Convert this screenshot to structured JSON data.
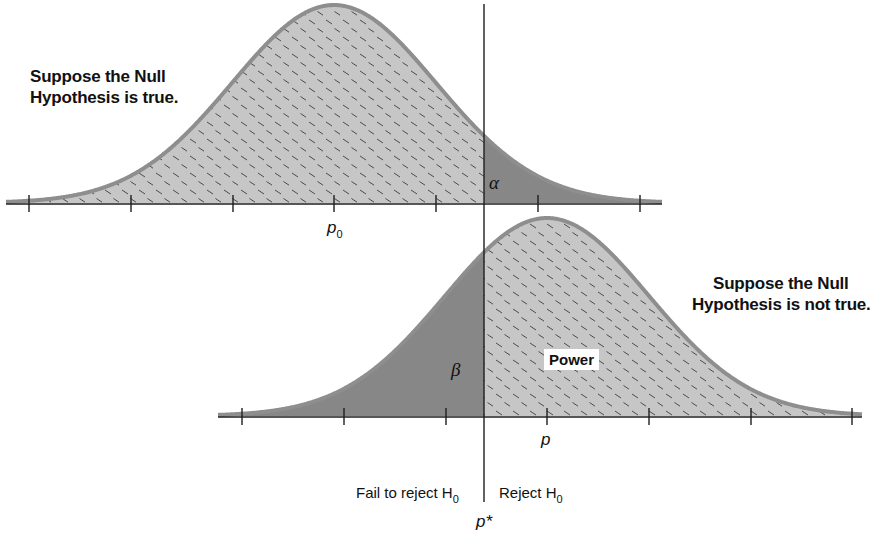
{
  "labels": {
    "null_true": [
      "Suppose the Null",
      "Hypothesis is true."
    ],
    "null_not_true": [
      "Suppose the Null",
      "Hypothesis is not true."
    ],
    "alpha": "α",
    "beta": "β",
    "power": "Power",
    "p0": "p",
    "p0_sub": "0",
    "p": "p",
    "p_star": "p*",
    "fail_to_reject": "Fail to reject H",
    "fail_to_reject_sub": "0",
    "reject": "Reject H",
    "reject_sub": "0"
  },
  "colors": {
    "light_fill": "#c6c6c6",
    "dark_fill": "#878787",
    "curve_stroke": "#8e8e8e",
    "axis": "#1e1e1e",
    "hatch": "#4a4a4a"
  },
  "chart_data": {
    "type": "area",
    "critical_value_label": "p*",
    "critical_x_px": 484,
    "series": [
      {
        "name": "Null distribution (H0 true)",
        "center_label": "p0",
        "center_px": 334,
        "sigma_px": 102,
        "baseline_px": 203,
        "peak_px": 5,
        "axis_from_px": 6,
        "axis_to_px": 662,
        "ticks_px": [
          29,
          131,
          233,
          334,
          436,
          538,
          640
        ],
        "regions": [
          {
            "name": "Fail to reject (1 - alpha)",
            "side": "left",
            "style": "light-hatched"
          },
          {
            "name": "alpha (Type I error)",
            "side": "right",
            "style": "dark"
          }
        ]
      },
      {
        "name": "Alternative distribution (H0 not true)",
        "center_label": "p",
        "center_px": 547,
        "sigma_px": 102,
        "baseline_px": 416,
        "peak_px": 218,
        "axis_from_px": 218,
        "axis_to_px": 862,
        "ticks_px": [
          242,
          344,
          446,
          547,
          649,
          751,
          852
        ],
        "regions": [
          {
            "name": "beta (Type II error)",
            "side": "left",
            "style": "dark"
          },
          {
            "name": "Power",
            "side": "right",
            "style": "light-hatched"
          }
        ]
      }
    ]
  }
}
